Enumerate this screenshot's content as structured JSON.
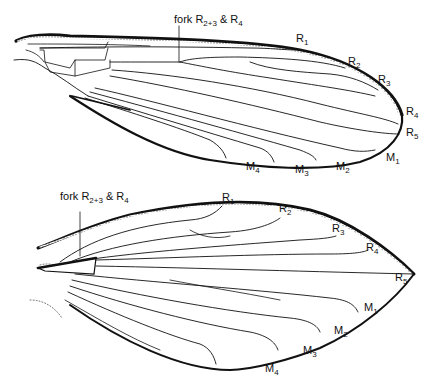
{
  "figure": {
    "upper_wing": {
      "fork_label": {
        "text": "fork R",
        "sub1": "2+3",
        "mid": " & R",
        "sub2": "4"
      },
      "vein_labels": [
        {
          "base": "R",
          "sub": "1"
        },
        {
          "base": "R",
          "sub": "2"
        },
        {
          "base": "R",
          "sub": "3"
        },
        {
          "base": "R",
          "sub": "4"
        },
        {
          "base": "R",
          "sub": "5"
        },
        {
          "base": "M",
          "sub": "1"
        },
        {
          "base": "M",
          "sub": "2"
        },
        {
          "base": "M",
          "sub": "3"
        },
        {
          "base": "M",
          "sub": "4"
        }
      ]
    },
    "lower_wing": {
      "fork_label": {
        "text": "fork R",
        "sub1": "2+3",
        "mid": " & R",
        "sub2": "4"
      },
      "vein_labels": [
        {
          "base": "R",
          "sub": "1"
        },
        {
          "base": "R",
          "sub": "2"
        },
        {
          "base": "R",
          "sub": "3"
        },
        {
          "base": "R",
          "sub": "4"
        },
        {
          "base": "R",
          "sub": "5"
        },
        {
          "base": "M",
          "sub": "1"
        },
        {
          "base": "M",
          "sub": "2"
        },
        {
          "base": "M",
          "sub": "3"
        },
        {
          "base": "M",
          "sub": "4"
        }
      ]
    }
  }
}
